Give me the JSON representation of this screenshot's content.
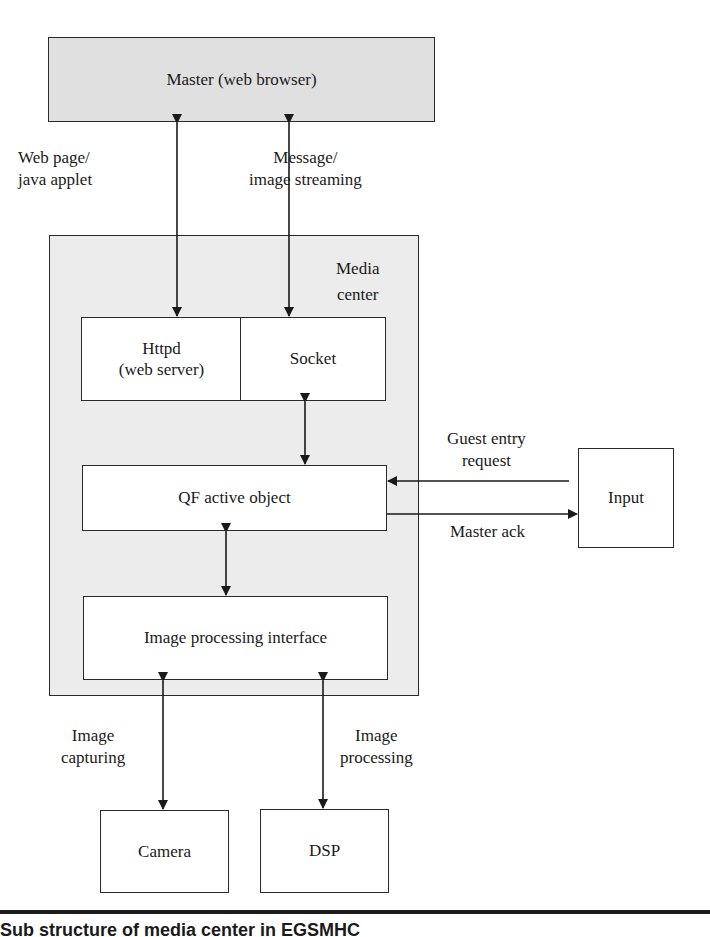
{
  "diagram": {
    "master": {
      "label": "Master (web browser)",
      "fill": "#e0e0e0"
    },
    "media_center": {
      "label_line1": "Media",
      "label_line2": "center",
      "fill": "#ececec"
    },
    "httpd": {
      "line1": "Httpd",
      "line2": "(web server)"
    },
    "socket": {
      "label": "Socket"
    },
    "qf": {
      "label": "QF active object"
    },
    "image_proc": {
      "label": "Image processing interface"
    },
    "input": {
      "label": "Input"
    },
    "camera": {
      "label": "Camera"
    },
    "dsp": {
      "label": "DSP"
    },
    "edges": {
      "web_page": {
        "line1": "Web page/",
        "line2": "java applet"
      },
      "message": {
        "line1": "Message/",
        "line2": "image streaming"
      },
      "guest": {
        "line1": "Guest entry",
        "line2": "request"
      },
      "master_ack": {
        "label": "Master ack"
      },
      "capturing": {
        "line1": "Image",
        "line2": "capturing"
      },
      "processing": {
        "line1": "Image",
        "line2": "processing"
      }
    }
  },
  "caption": {
    "text": "Sub structure of media center in EGSMHC"
  }
}
